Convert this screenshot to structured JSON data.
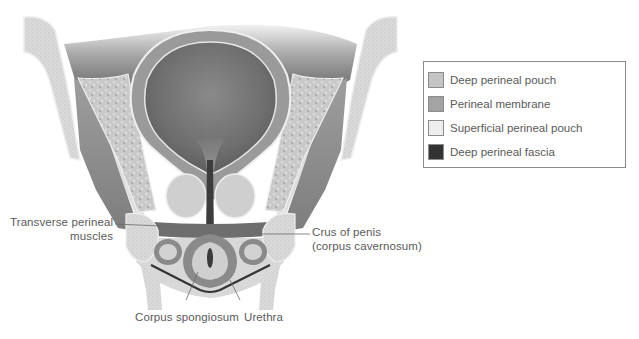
{
  "figure": {
    "colors": {
      "background": "#ffffff",
      "bone": "#d9d9d9",
      "bone_stipple": "#bdbdbd",
      "muscle": "#8f8f8f",
      "muscle_dark": "#6e6e6e",
      "fat": "#c8c8c8",
      "bladder_wall": "#9a9a9a",
      "bladder_lumen": "#6f6f6f",
      "prostate": "#cfcfcf",
      "fascia_dark": "#333333",
      "label_text": "#5a5a5a",
      "leader_line": "#6a6a6a"
    }
  },
  "labels": {
    "transverse_perineal": {
      "line1": "Transverse perineal",
      "line2": "muscles"
    },
    "crus_of_penis": {
      "line1": "Crus of penis",
      "line2": "(corpus cavernosum)"
    },
    "corpus_spongiosum": "Corpus spongiosum",
    "urethra": "Urethra"
  },
  "legend": {
    "items": [
      {
        "label": "Deep perineal pouch",
        "color": "#c4c4c4"
      },
      {
        "label": "Perineal membrane",
        "color": "#a3a3a3"
      },
      {
        "label": "Superficial perineal pouch",
        "color": "#eeeeee"
      },
      {
        "label": "Deep perineal fascia",
        "color": "#333333"
      }
    ]
  }
}
